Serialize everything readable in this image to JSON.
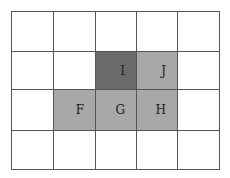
{
  "diagram": {
    "rows": 4,
    "cols": 5,
    "col_edges": [
      0,
      42,
      84,
      125,
      166,
      208
    ],
    "row_edges": [
      0,
      40,
      78,
      119,
      158
    ],
    "colors": {
      "dark": "#6a6a6a",
      "mid": "#a8a8a8",
      "empty": "#ffffff",
      "line": "#555555"
    },
    "cells": [
      {
        "row": 1,
        "col": 2,
        "label": "I",
        "shade": "dark"
      },
      {
        "row": 1,
        "col": 3,
        "label": "J",
        "shade": "mid"
      },
      {
        "row": 2,
        "col": 1,
        "label": "F",
        "shade": "mid"
      },
      {
        "row": 2,
        "col": 2,
        "label": "G",
        "shade": "mid"
      },
      {
        "row": 2,
        "col": 3,
        "label": "H",
        "shade": "mid"
      }
    ]
  }
}
